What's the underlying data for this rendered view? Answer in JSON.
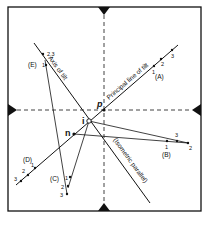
{
  "diagram": {
    "type": "photogrammetry tilted photograph geometry",
    "points": {
      "p": {
        "label": "p",
        "x": 104,
        "y": 110
      },
      "i": {
        "label": "i",
        "x": 89,
        "y": 121
      },
      "n": {
        "label": "n",
        "x": 74,
        "y": 134
      }
    },
    "lines": {
      "principal_line": {
        "label": "Principal line of tilt"
      },
      "axis_of_tilt": {
        "label": "Axis of tilt"
      },
      "isometric_parallel": {
        "label": "(Isometric parallel)"
      }
    },
    "groups": {
      "A": {
        "label": "(A)",
        "marks": [
          "1",
          "2",
          "3"
        ]
      },
      "B": {
        "label": "(B)",
        "marks": [
          "1",
          "2",
          "3"
        ]
      },
      "C": {
        "label": "(C)",
        "marks": [
          "1",
          "2",
          "3"
        ]
      },
      "D": {
        "label": "(D)",
        "marks": [
          "1",
          "2",
          "3"
        ]
      },
      "E": {
        "label": "(E)",
        "marks": [
          "1",
          "2,3"
        ]
      }
    },
    "colors": {
      "ink": "#111111",
      "background": "#ffffff"
    }
  }
}
